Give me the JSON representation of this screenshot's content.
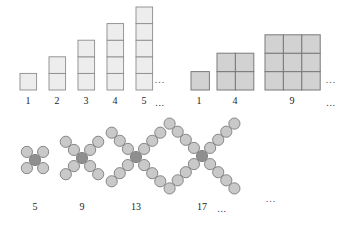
{
  "figure": {
    "title": "",
    "background_color": "#ffffff",
    "width": 345,
    "height": 225
  },
  "chart_data": {
    "type": "diagram",
    "title": "",
    "patterns": [
      {
        "id": "staircase-columns",
        "name": "Column staircase of unit squares",
        "element_shape": "square",
        "arrangement": "single vertical column, bottom aligned",
        "labels": [
          "1",
          "2",
          "3",
          "4",
          "5"
        ],
        "values": [
          1,
          2,
          3,
          4,
          5
        ],
        "trailing_label": "...",
        "trailing_figure": "...",
        "fill_color": "#ededed",
        "stroke_color": "#8c8c8c"
      },
      {
        "id": "square-numbers",
        "name": "Square arrays of unit squares",
        "element_shape": "square",
        "arrangement": "n by n square grid, bottom aligned",
        "labels": [
          "1",
          "4",
          "9"
        ],
        "values": [
          1,
          4,
          9
        ],
        "grid_sides": [
          1,
          2,
          3
        ],
        "trailing_label": "...",
        "trailing_figure": "...",
        "fill_color": "#d2d2d2",
        "stroke_color": "#7a7a7a"
      },
      {
        "id": "x-crosses",
        "name": "X shaped crosses of circles",
        "element_shape": "circle",
        "arrangement": "one centre circle with four diagonal arms",
        "labels": [
          "5",
          "9",
          "13",
          "17"
        ],
        "values": [
          5,
          9,
          13,
          17
        ],
        "arm_lengths": [
          1,
          2,
          3,
          4
        ],
        "trailing_label": "...",
        "trailing_figure": "...",
        "fill_color": "#c9c9c9",
        "center_fill_color": "#8f8f8f",
        "stroke_color": "#7c7c7c"
      }
    ]
  },
  "row1": {
    "labels": [
      {
        "text": "1",
        "x": 28,
        "y": 95
      },
      {
        "text": "2",
        "x": 57,
        "y": 95
      },
      {
        "text": "3",
        "x": 86,
        "y": 95
      },
      {
        "text": "4",
        "x": 115,
        "y": 95
      },
      {
        "text": "5",
        "x": 144,
        "y": 95
      }
    ],
    "label_dots": {
      "text": "...",
      "x": 160,
      "y": 97
    },
    "figure_dots": {
      "text": "...",
      "x": 160,
      "y": 74
    }
  },
  "row2": {
    "labels": [
      {
        "text": "1",
        "x": 199,
        "y": 95
      },
      {
        "text": "4",
        "x": 235,
        "y": 95
      },
      {
        "text": "9",
        "x": 292,
        "y": 95
      }
    ],
    "label_dots": {
      "text": "...",
      "x": 331,
      "y": 97
    },
    "figure_dots": {
      "text": "...",
      "x": 331,
      "y": 74
    }
  },
  "row3": {
    "labels": [
      {
        "text": "5",
        "x": 35,
        "y": 201
      },
      {
        "text": "9",
        "x": 82,
        "y": 201
      },
      {
        "text": "13",
        "x": 136,
        "y": 201
      },
      {
        "text": "17",
        "x": 202,
        "y": 201
      }
    ],
    "label_dots": {
      "text": "...",
      "x": 222,
      "y": 203
    },
    "figure_dots": {
      "text": "...",
      "x": 271,
      "y": 193
    }
  }
}
